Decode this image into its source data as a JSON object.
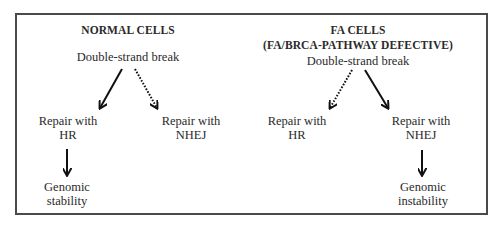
{
  "diagram": {
    "left_panel": {
      "title": "NORMAL CELLS",
      "start": "Double-strand break",
      "branch_left": {
        "line1": "Repair with",
        "line2": "HR",
        "arrow": "solid"
      },
      "branch_right": {
        "line1": "Repair with",
        "line2": "NHEJ",
        "arrow": "dotted"
      },
      "outcome": {
        "line1": "Genomic",
        "line2": "stability"
      }
    },
    "right_panel": {
      "title_line1": "FA CELLS",
      "title_line2": "(FA/BRCA-PATHWAY DEFECTIVE)",
      "start": "Double-strand break",
      "branch_left": {
        "line1": "Repair with",
        "line2": "HR",
        "arrow": "dotted"
      },
      "branch_right": {
        "line1": "Repair with",
        "line2": "NHEJ",
        "arrow": "solid"
      },
      "outcome": {
        "line1": "Genomic",
        "line2": "instability"
      }
    },
    "colors": {
      "line": "#111111",
      "border": "#4a4a4a",
      "text": "#2a2a2a"
    }
  }
}
